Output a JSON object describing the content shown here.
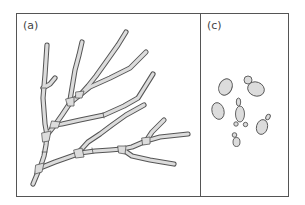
{
  "figure": {
    "panels": [
      {
        "id": "a",
        "label": "(a)",
        "content": "branching septate hyphae"
      },
      {
        "id": "c",
        "label": "(c)",
        "content": "budding yeast cells"
      }
    ]
  },
  "colors": {
    "outline": "#555555",
    "frame": "#555555",
    "fill": "#dcdcdc",
    "background": "#ffffff"
  }
}
